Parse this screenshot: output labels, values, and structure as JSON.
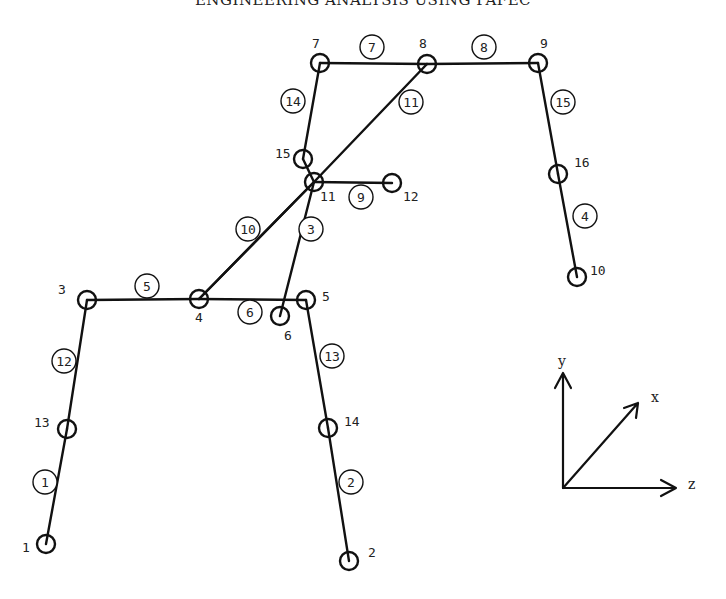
{
  "title": "ENGINEERING ANALYSIS USING PAFEC",
  "nodes": [
    {
      "id": "1",
      "x": 46,
      "y": 544,
      "lx": 22,
      "ly": 552
    },
    {
      "id": "2",
      "x": 349,
      "y": 561,
      "lx": 368,
      "ly": 557
    },
    {
      "id": "3",
      "x": 87,
      "y": 300,
      "lx": 58,
      "ly": 294
    },
    {
      "id": "4",
      "x": 199,
      "y": 299,
      "lx": 195,
      "ly": 322
    },
    {
      "id": "5",
      "x": 306,
      "y": 300,
      "lx": 322,
      "ly": 301
    },
    {
      "id": "6",
      "x": 280,
      "y": 316,
      "lx": 284,
      "ly": 340
    },
    {
      "id": "7",
      "x": 320,
      "y": 63,
      "lx": 312,
      "ly": 48
    },
    {
      "id": "8",
      "x": 427,
      "y": 64,
      "lx": 419,
      "ly": 48
    },
    {
      "id": "9",
      "x": 538,
      "y": 63,
      "lx": 540,
      "ly": 48
    },
    {
      "id": "10",
      "x": 577,
      "y": 277,
      "lx": 590,
      "ly": 275
    },
    {
      "id": "11",
      "x": 314,
      "y": 182,
      "lx": 320,
      "ly": 201
    },
    {
      "id": "12",
      "x": 392,
      "y": 183,
      "lx": 403,
      "ly": 201
    },
    {
      "id": "13",
      "x": 67,
      "y": 429,
      "lx": 34,
      "ly": 427
    },
    {
      "id": "14",
      "x": 328,
      "y": 428,
      "lx": 344,
      "ly": 426
    },
    {
      "id": "15",
      "x": 303,
      "y": 159,
      "lx": 275,
      "ly": 158
    },
    {
      "id": "16",
      "x": 558,
      "y": 174,
      "lx": 574,
      "ly": 167
    }
  ],
  "elements": [
    {
      "id": "1",
      "from": "1",
      "to": "13",
      "lx": 45,
      "ly": 482
    },
    {
      "id": "2",
      "from": "14",
      "to": "2",
      "lx": 351,
      "ly": 482
    },
    {
      "id": "3",
      "from": "11",
      "to": "6",
      "lx": 311,
      "ly": 229
    },
    {
      "id": "4",
      "from": "16",
      "to": "10",
      "lx": 585,
      "ly": 216
    },
    {
      "id": "5",
      "from": "3",
      "to": "4",
      "lx": 147,
      "ly": 286
    },
    {
      "id": "6",
      "from": "4",
      "to": "5",
      "lx": 250,
      "ly": 312
    },
    {
      "id": "7",
      "from": "7",
      "to": "8",
      "lx": 372,
      "ly": 47
    },
    {
      "id": "8",
      "from": "8",
      "to": "9",
      "lx": 484,
      "ly": 47
    },
    {
      "id": "9",
      "from": "11",
      "to": "12",
      "lx": 361,
      "ly": 197
    },
    {
      "id": "10",
      "from": "4",
      "to": "11",
      "lx": 248,
      "ly": 229
    },
    {
      "id": "11",
      "from": "11",
      "to": "8",
      "lx": 411,
      "ly": 102
    },
    {
      "id": "12",
      "from": "3",
      "to": "13",
      "lx": 64,
      "ly": 361
    },
    {
      "id": "13",
      "from": "5",
      "to": "14",
      "lx": 332,
      "ly": 356
    },
    {
      "id": "14",
      "from": "15",
      "to": "7",
      "lx": 293,
      "ly": 101
    },
    {
      "id": "15",
      "from": "9",
      "to": "16",
      "lx": 563,
      "ly": 102
    }
  ],
  "extra_segments": [
    {
      "from": "15",
      "to": "11"
    },
    {
      "from": "11",
      "to": "4"
    }
  ],
  "axes": {
    "origin": {
      "x": 563,
      "y": 488
    },
    "y_label": "y",
    "x_label": "x",
    "z_label": "z"
  }
}
